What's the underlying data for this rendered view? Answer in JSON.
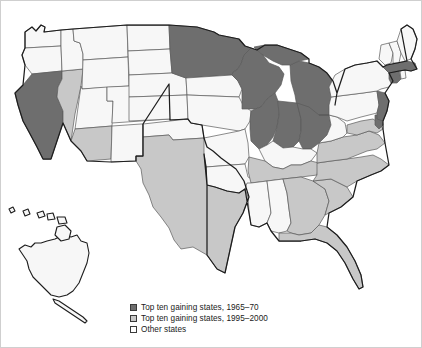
{
  "figure": {
    "background_color": "#ffffff"
  },
  "colors": {
    "dark_gray": "#6e6e6e",
    "light_gray": "#c8c8c8",
    "white": "#f7f7f7",
    "state_border": "#5a5a5a",
    "nation_border": "#1d1d1d",
    "text": "#1a1a1a"
  },
  "legend": {
    "items": [
      {
        "label": "Top ten gaining states, 1965–70",
        "swatch": "#6e6e6e",
        "category": "gaining-1965-70"
      },
      {
        "label": "Top ten gaining states, 1995–2000",
        "swatch": "#c8c8c8",
        "category": "gaining-1995-2000"
      },
      {
        "label": "Other states",
        "swatch": "#ffffff",
        "category": "other"
      }
    ]
  },
  "chart_data": {
    "type": "choropleth-map",
    "region": "United States",
    "categories": [
      "Top ten gaining states, 1965–70",
      "Top ten gaining states, 1995–2000",
      "Other states"
    ],
    "category_colors": [
      "#6e6e6e",
      "#c8c8c8",
      "#ffffff"
    ],
    "legend_position": "bottom-center",
    "insets": [
      "Alaska",
      "Hawaii"
    ],
    "states": [
      {
        "code": "WA",
        "name": "Washington",
        "category": "other"
      },
      {
        "code": "OR",
        "name": "Oregon",
        "category": "other"
      },
      {
        "code": "CA",
        "name": "California",
        "category": "gaining-1965-70"
      },
      {
        "code": "NV",
        "name": "Nevada",
        "category": "gaining-1995-2000"
      },
      {
        "code": "ID",
        "name": "Idaho",
        "category": "other"
      },
      {
        "code": "MT",
        "name": "Montana",
        "category": "other"
      },
      {
        "code": "WY",
        "name": "Wyoming",
        "category": "other"
      },
      {
        "code": "UT",
        "name": "Utah",
        "category": "other"
      },
      {
        "code": "AZ",
        "name": "Arizona",
        "category": "gaining-1995-2000"
      },
      {
        "code": "CO",
        "name": "Colorado",
        "category": "other"
      },
      {
        "code": "NM",
        "name": "New Mexico",
        "category": "other"
      },
      {
        "code": "ND",
        "name": "North Dakota",
        "category": "other"
      },
      {
        "code": "SD",
        "name": "South Dakota",
        "category": "other"
      },
      {
        "code": "NE",
        "name": "Nebraska",
        "category": "other"
      },
      {
        "code": "KS",
        "name": "Kansas",
        "category": "other"
      },
      {
        "code": "OK",
        "name": "Oklahoma",
        "category": "other"
      },
      {
        "code": "TX",
        "name": "Texas",
        "category": "gaining-1995-2000"
      },
      {
        "code": "MN",
        "name": "Minnesota",
        "category": "gaining-1965-70"
      },
      {
        "code": "IA",
        "name": "Iowa",
        "category": "other"
      },
      {
        "code": "MO",
        "name": "Missouri",
        "category": "other"
      },
      {
        "code": "AR",
        "name": "Arkansas",
        "category": "other"
      },
      {
        "code": "LA",
        "name": "Louisiana",
        "category": "other"
      },
      {
        "code": "WI",
        "name": "Wisconsin",
        "category": "gaining-1965-70"
      },
      {
        "code": "IL",
        "name": "Illinois",
        "category": "gaining-1965-70"
      },
      {
        "code": "MI",
        "name": "Michigan",
        "category": "gaining-1965-70"
      },
      {
        "code": "IN",
        "name": "Indiana",
        "category": "gaining-1965-70"
      },
      {
        "code": "OH",
        "name": "Ohio",
        "category": "gaining-1965-70"
      },
      {
        "code": "KY",
        "name": "Kentucky",
        "category": "other"
      },
      {
        "code": "TN",
        "name": "Tennessee",
        "category": "gaining-1995-2000"
      },
      {
        "code": "MS",
        "name": "Mississippi",
        "category": "other"
      },
      {
        "code": "AL",
        "name": "Alabama",
        "category": "other"
      },
      {
        "code": "GA",
        "name": "Georgia",
        "category": "gaining-1995-2000"
      },
      {
        "code": "FL",
        "name": "Florida",
        "category": "gaining-1995-2000"
      },
      {
        "code": "SC",
        "name": "South Carolina",
        "category": "gaining-1995-2000"
      },
      {
        "code": "NC",
        "name": "North Carolina",
        "category": "gaining-1995-2000"
      },
      {
        "code": "VA",
        "name": "Virginia",
        "category": "gaining-1995-2000"
      },
      {
        "code": "WV",
        "name": "West Virginia",
        "category": "other"
      },
      {
        "code": "MD",
        "name": "Maryland",
        "category": "gaining-1995-2000"
      },
      {
        "code": "DE",
        "name": "Delaware",
        "category": "gaining-1965-70"
      },
      {
        "code": "PA",
        "name": "Pennsylvania",
        "category": "other"
      },
      {
        "code": "NJ",
        "name": "New Jersey",
        "category": "gaining-1965-70"
      },
      {
        "code": "NY",
        "name": "New York",
        "category": "other"
      },
      {
        "code": "CT",
        "name": "Connecticut",
        "category": "gaining-1965-70"
      },
      {
        "code": "RI",
        "name": "Rhode Island",
        "category": "other"
      },
      {
        "code": "MA",
        "name": "Massachusetts",
        "category": "gaining-1965-70"
      },
      {
        "code": "VT",
        "name": "Vermont",
        "category": "other"
      },
      {
        "code": "NH",
        "name": "New Hampshire",
        "category": "other"
      },
      {
        "code": "ME",
        "name": "Maine",
        "category": "other"
      },
      {
        "code": "AK",
        "name": "Alaska",
        "category": "other"
      },
      {
        "code": "HI",
        "name": "Hawaii",
        "category": "other"
      }
    ],
    "counts": {
      "gaining-1965-70": 10,
      "gaining-1995-2000": 10,
      "other": 30
    }
  }
}
